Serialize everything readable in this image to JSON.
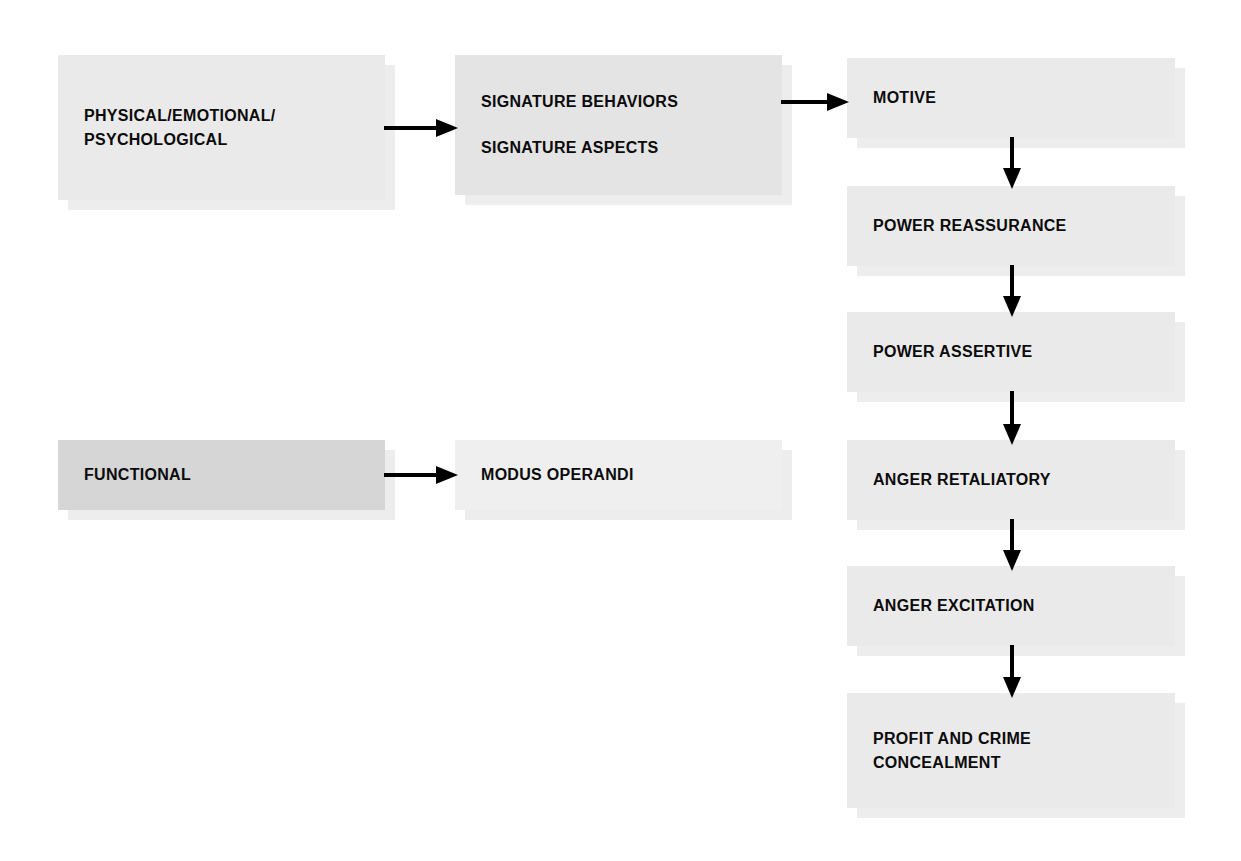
{
  "diagram": {
    "background_color": "#ffffff",
    "text_color": "#0b0b0b",
    "arrow_color": "#000000",
    "shadow_color": "#ededed",
    "nodes": [
      {
        "id": "physical-emotional-psychological",
        "lines": [
          "PHYSICAL/EMOTIONAL/",
          "PSYCHOLOGICAL"
        ],
        "fill": "#eaeaea",
        "column": "left",
        "row": 1
      },
      {
        "id": "signature",
        "lines": [
          "SIGNATURE BEHAVIORS",
          "SIGNATURE ASPECTS"
        ],
        "fill": "#e4e4e4",
        "column": "middle",
        "row": 1
      },
      {
        "id": "motive",
        "lines": [
          "MOTIVE"
        ],
        "fill": "#eaeaea",
        "column": "right",
        "row": 1
      },
      {
        "id": "power-reassurance",
        "lines": [
          "POWER REASSURANCE"
        ],
        "fill": "#eaeaea",
        "column": "right",
        "row": 2
      },
      {
        "id": "power-assertive",
        "lines": [
          "POWER ASSERTIVE"
        ],
        "fill": "#eaeaea",
        "column": "right",
        "row": 3
      },
      {
        "id": "anger-retaliatory",
        "lines": [
          "ANGER RETALIATORY"
        ],
        "fill": "#eaeaea",
        "column": "right",
        "row": 4
      },
      {
        "id": "anger-excitation",
        "lines": [
          "ANGER EXCITATION"
        ],
        "fill": "#eaeaea",
        "column": "right",
        "row": 5
      },
      {
        "id": "profit-and-crime-concealment",
        "lines": [
          "PROFIT AND CRIME",
          "CONCEALMENT"
        ],
        "fill": "#eaeaea",
        "column": "right",
        "row": 6
      },
      {
        "id": "functional",
        "lines": [
          "FUNCTIONAL"
        ],
        "fill": "#d6d6d6",
        "column": "left",
        "row": 2
      },
      {
        "id": "modus-operandi",
        "lines": [
          "MODUS OPERANDI"
        ],
        "fill": "#efefef",
        "column": "middle",
        "row": 2
      }
    ],
    "edges": [
      {
        "id": "physical-to-signature",
        "from": "physical-emotional-psychological",
        "to": "signature",
        "direction": "right"
      },
      {
        "id": "signature-to-motive",
        "from": "signature",
        "to": "motive",
        "direction": "right"
      },
      {
        "id": "motive-to-power-reassurance",
        "from": "motive",
        "to": "power-reassurance",
        "direction": "down"
      },
      {
        "id": "power-reassurance-to-power-assertive",
        "from": "power-reassurance",
        "to": "power-assertive",
        "direction": "down"
      },
      {
        "id": "power-assertive-to-anger-retaliatory",
        "from": "power-assertive",
        "to": "anger-retaliatory",
        "direction": "down"
      },
      {
        "id": "anger-retaliatory-to-anger-excitation",
        "from": "anger-retaliatory",
        "to": "anger-excitation",
        "direction": "down"
      },
      {
        "id": "anger-excitation-to-profit",
        "from": "anger-excitation",
        "to": "profit-and-crime-concealment",
        "direction": "down"
      },
      {
        "id": "functional-to-modus-operandi",
        "from": "functional",
        "to": "modus-operandi",
        "direction": "right"
      }
    ]
  },
  "nodeText": {
    "physical": {
      "l1": "PHYSICAL/EMOTIONAL/",
      "l2": "PSYCHOLOGICAL"
    },
    "signature": {
      "l1": "SIGNATURE BEHAVIORS",
      "l2": "SIGNATURE ASPECTS"
    },
    "motive": {
      "l1": "MOTIVE"
    },
    "powerReassurance": {
      "l1": "POWER REASSURANCE"
    },
    "powerAssertive": {
      "l1": "POWER ASSERTIVE"
    },
    "angerRetaliatory": {
      "l1": "ANGER RETALIATORY"
    },
    "angerExcitation": {
      "l1": "ANGER EXCITATION"
    },
    "profit": {
      "l1": "PROFIT AND CRIME",
      "l2": "CONCEALMENT"
    },
    "functional": {
      "l1": "FUNCTIONAL"
    },
    "modusOperandi": {
      "l1": "MODUS OPERANDI"
    }
  }
}
